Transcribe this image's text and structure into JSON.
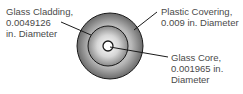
{
  "diagram": {
    "layers": [
      {
        "name": "Plastic Covering",
        "diameter": "0.009 in. Diameter"
      },
      {
        "name": "Glass Cladding",
        "diameter": "0.0049126 in. Diameter"
      },
      {
        "name": "Glass Core",
        "diameter": "0.001965 in. Diameter"
      }
    ],
    "labels": {
      "cladding": {
        "line1": "Glass Cladding,",
        "line2": "0.0049126",
        "line3": "in. Diameter"
      },
      "plastic": {
        "line1": "Plastic Covering,",
        "line2": "0.009 in. Diameter"
      },
      "core": {
        "line1": "Glass Core,",
        "line2": "0.001965 in.",
        "line3": "Diameter"
      }
    },
    "colors": {
      "outline": "#1a1a1a",
      "outer_light": "#d8d8d8",
      "outer_dark": "#6e6e6e",
      "inner_light": "#f4f4f4",
      "inner_dark": "#8a8a8a",
      "text": "#4a4a4a"
    }
  }
}
